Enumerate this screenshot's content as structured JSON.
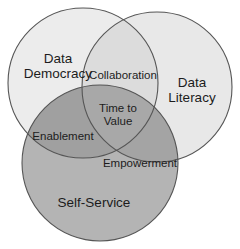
{
  "diagram": {
    "type": "venn-3-circle",
    "width": 240,
    "height": 249,
    "background": "#ffffff",
    "stroke_color": "#555555",
    "stroke_width": 1.1,
    "text_color": "#1c1c1c"
  },
  "circles": [
    {
      "id": "data-democracy",
      "label": "Data\nDemocracy",
      "label_lines": [
        "Data",
        "Democracy"
      ],
      "label_x": 58,
      "label_y": 66,
      "cx": 83,
      "cy": 83,
      "r": 75,
      "fill": "#ececec"
    },
    {
      "id": "data-literacy",
      "label": "Data\nLiteracy",
      "label_lines": [
        "Data",
        "Literacy"
      ],
      "label_x": 192,
      "label_y": 90,
      "cx": 157,
      "cy": 87,
      "r": 75,
      "fill": "#e8e8e8"
    },
    {
      "id": "self-service",
      "label": "Self-Service",
      "label_lines": [
        "Self-Service"
      ],
      "label_x": 94,
      "label_y": 203,
      "cx": 100,
      "cy": 163,
      "r": 78,
      "fill": "#b4b4b4"
    }
  ],
  "overlaps": [
    {
      "id": "collaboration",
      "label": "Collaboration",
      "members": [
        "data-democracy",
        "data-literacy"
      ],
      "label_x": 123,
      "label_y": 76,
      "fill": "#dcdcdc"
    },
    {
      "id": "enablement",
      "label": "Enablement",
      "members": [
        "data-democracy",
        "self-service"
      ],
      "label_x": 63,
      "label_y": 137,
      "fill": "#a0a0a0"
    },
    {
      "id": "empowerment",
      "label": "Empowerment",
      "members": [
        "data-literacy",
        "self-service"
      ],
      "label_x": 140,
      "label_y": 164,
      "fill": "#a4a4a4"
    }
  ],
  "center": {
    "id": "time-to-value",
    "label": "Time to\nValue",
    "label_lines": [
      "Time to",
      "Value"
    ],
    "label_x": 118,
    "label_y": 115,
    "fill": "#a8a8a8"
  }
}
